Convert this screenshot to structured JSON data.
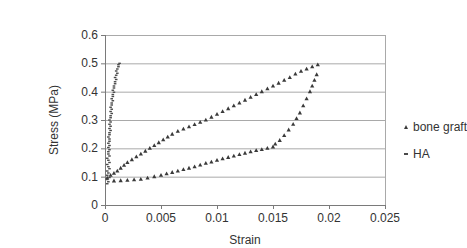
{
  "chart_data": {
    "type": "scatter",
    "title": "",
    "xlabel": "Strain",
    "ylabel": "Stress (MPa)",
    "xlim": [
      0,
      0.025
    ],
    "ylim": [
      0,
      0.6
    ],
    "grid": "horizontal",
    "legend_position": "right-outside",
    "layout": {
      "left": 65,
      "right": 345,
      "top": 19,
      "bottom": 189
    },
    "colors": {
      "grid": "#a9a9a9",
      "axis": "#7a7a7a",
      "text": "#333333",
      "marker": "#3a3a3a"
    },
    "xticks": [
      {
        "v": 0,
        "label": "0"
      },
      {
        "v": 0.005,
        "label": "0.005"
      },
      {
        "v": 0.01,
        "label": "0.01"
      },
      {
        "v": 0.015,
        "label": "0.015"
      },
      {
        "v": 0.02,
        "label": "0.02"
      },
      {
        "v": 0.025,
        "label": "0.025"
      }
    ],
    "yticks": [
      {
        "v": 0,
        "label": "0"
      },
      {
        "v": 0.1,
        "label": "0.1"
      },
      {
        "v": 0.2,
        "label": "0.2"
      },
      {
        "v": 0.3,
        "label": "0.3"
      },
      {
        "v": 0.4,
        "label": "0.4"
      },
      {
        "v": 0.5,
        "label": "0.5"
      },
      {
        "v": 0.6,
        "label": "0.6"
      }
    ],
    "series": [
      {
        "name": "bone graft",
        "marker": "triangle",
        "color": "#3a3a3a",
        "description": "hysteresis loop: loading branch up to peak (0.019, 0.50), unloading branch back to origin",
        "points": [
          [
            0.0002,
            0.095
          ],
          [
            0.0005,
            0.105
          ],
          [
            0.0008,
            0.112
          ],
          [
            0.0011,
            0.12
          ],
          [
            0.0014,
            0.13
          ],
          [
            0.0017,
            0.14
          ],
          [
            0.002,
            0.15
          ],
          [
            0.0024,
            0.16
          ],
          [
            0.0028,
            0.17
          ],
          [
            0.0032,
            0.18
          ],
          [
            0.0036,
            0.19
          ],
          [
            0.004,
            0.2
          ],
          [
            0.0044,
            0.21
          ],
          [
            0.0048,
            0.22
          ],
          [
            0.0052,
            0.23
          ],
          [
            0.0056,
            0.24
          ],
          [
            0.006,
            0.25
          ],
          [
            0.0065,
            0.26
          ],
          [
            0.007,
            0.268
          ],
          [
            0.0075,
            0.276
          ],
          [
            0.008,
            0.284
          ],
          [
            0.0085,
            0.292
          ],
          [
            0.009,
            0.3
          ],
          [
            0.0095,
            0.31
          ],
          [
            0.01,
            0.32
          ],
          [
            0.0105,
            0.33
          ],
          [
            0.011,
            0.34
          ],
          [
            0.0115,
            0.35
          ],
          [
            0.012,
            0.36
          ],
          [
            0.0125,
            0.37
          ],
          [
            0.013,
            0.38
          ],
          [
            0.0135,
            0.39
          ],
          [
            0.014,
            0.4
          ],
          [
            0.0145,
            0.41
          ],
          [
            0.015,
            0.42
          ],
          [
            0.0155,
            0.43
          ],
          [
            0.016,
            0.44
          ],
          [
            0.0165,
            0.45
          ],
          [
            0.017,
            0.462
          ],
          [
            0.0175,
            0.472
          ],
          [
            0.018,
            0.48
          ],
          [
            0.0185,
            0.488
          ],
          [
            0.019,
            0.495
          ],
          [
            0.0189,
            0.46
          ],
          [
            0.0187,
            0.44
          ],
          [
            0.0185,
            0.42
          ],
          [
            0.0183,
            0.4
          ],
          [
            0.018,
            0.375
          ],
          [
            0.0177,
            0.35
          ],
          [
            0.0174,
            0.325
          ],
          [
            0.0171,
            0.305
          ],
          [
            0.0168,
            0.285
          ],
          [
            0.0164,
            0.265
          ],
          [
            0.016,
            0.245
          ],
          [
            0.0156,
            0.228
          ],
          [
            0.0152,
            0.215
          ],
          [
            0.015,
            0.205
          ],
          [
            0.0145,
            0.2
          ],
          [
            0.014,
            0.196
          ],
          [
            0.0135,
            0.192
          ],
          [
            0.013,
            0.188
          ],
          [
            0.0125,
            0.183
          ],
          [
            0.012,
            0.178
          ],
          [
            0.0115,
            0.173
          ],
          [
            0.011,
            0.168
          ],
          [
            0.0105,
            0.163
          ],
          [
            0.01,
            0.158
          ],
          [
            0.0095,
            0.152
          ],
          [
            0.009,
            0.147
          ],
          [
            0.0085,
            0.141
          ],
          [
            0.008,
            0.135
          ],
          [
            0.0075,
            0.13
          ],
          [
            0.007,
            0.125
          ],
          [
            0.0065,
            0.12
          ],
          [
            0.006,
            0.115
          ],
          [
            0.0055,
            0.11
          ],
          [
            0.005,
            0.105
          ],
          [
            0.0044,
            0.1
          ],
          [
            0.0038,
            0.095
          ],
          [
            0.0032,
            0.091
          ],
          [
            0.0026,
            0.089
          ],
          [
            0.002,
            0.087
          ],
          [
            0.0014,
            0.086
          ],
          [
            0.0008,
            0.085
          ]
        ]
      },
      {
        "name": "HA",
        "marker": "dash",
        "color": "#4a4a4a",
        "description": "very stiff: near-vertical dense band from (0.0002, 0.075) to (0.0013, 0.50)",
        "points": [
          [
            0.0002,
            0.075
          ],
          [
            0.0003,
            0.082
          ],
          [
            0.0002,
            0.09
          ],
          [
            0.0004,
            0.097
          ],
          [
            0.0002,
            0.105
          ],
          [
            0.0003,
            0.113
          ],
          [
            0.0002,
            0.12
          ],
          [
            0.0004,
            0.128
          ],
          [
            0.0003,
            0.135
          ],
          [
            0.0002,
            0.143
          ],
          [
            0.0004,
            0.15
          ],
          [
            0.0003,
            0.158
          ],
          [
            0.0002,
            0.165
          ],
          [
            0.0004,
            0.173
          ],
          [
            0.0003,
            0.18
          ],
          [
            0.0003,
            0.188
          ],
          [
            0.0004,
            0.195
          ],
          [
            0.0003,
            0.203
          ],
          [
            0.0004,
            0.21
          ],
          [
            0.0003,
            0.218
          ],
          [
            0.0004,
            0.225
          ],
          [
            0.0004,
            0.233
          ],
          [
            0.0003,
            0.24
          ],
          [
            0.0004,
            0.248
          ],
          [
            0.0004,
            0.255
          ],
          [
            0.0005,
            0.263
          ],
          [
            0.0004,
            0.27
          ],
          [
            0.0005,
            0.278
          ],
          [
            0.0004,
            0.285
          ],
          [
            0.0005,
            0.293
          ],
          [
            0.0004,
            0.3
          ],
          [
            0.0005,
            0.308
          ],
          [
            0.0005,
            0.315
          ],
          [
            0.0006,
            0.323
          ],
          [
            0.0005,
            0.33
          ],
          [
            0.0006,
            0.338
          ],
          [
            0.0005,
            0.345
          ],
          [
            0.0006,
            0.353
          ],
          [
            0.0006,
            0.36
          ],
          [
            0.0007,
            0.368
          ],
          [
            0.0006,
            0.375
          ],
          [
            0.0007,
            0.383
          ],
          [
            0.0007,
            0.39
          ],
          [
            0.0008,
            0.398
          ],
          [
            0.0007,
            0.405
          ],
          [
            0.0008,
            0.413
          ],
          [
            0.0008,
            0.42
          ],
          [
            0.0009,
            0.428
          ],
          [
            0.0009,
            0.435
          ],
          [
            0.001,
            0.443
          ],
          [
            0.0009,
            0.45
          ],
          [
            0.001,
            0.458
          ],
          [
            0.0011,
            0.465
          ],
          [
            0.001,
            0.473
          ],
          [
            0.0011,
            0.48
          ],
          [
            0.0012,
            0.488
          ],
          [
            0.0012,
            0.495
          ],
          [
            0.0013,
            0.5
          ]
        ]
      }
    ]
  }
}
